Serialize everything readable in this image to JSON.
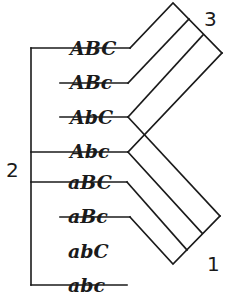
{
  "diagram": {
    "type": "genotype-grouping",
    "ink_color": "#1a1a1a",
    "background": "#ffffff",
    "group_labels": [
      {
        "id": "group-1",
        "text": "1"
      },
      {
        "id": "group-2",
        "text": "2"
      },
      {
        "id": "group-3",
        "text": "3"
      }
    ],
    "genotypes": [
      {
        "label": "ABC",
        "struck": true
      },
      {
        "label": "ABc",
        "struck": true
      },
      {
        "label": "AbC",
        "struck": true
      },
      {
        "label": "Abc",
        "struck": true
      },
      {
        "label": "aBC",
        "struck": true
      },
      {
        "label": "aBc",
        "struck": true
      },
      {
        "label": "abC",
        "struck": false
      },
      {
        "label": "abc",
        "struck": true
      }
    ],
    "groups": {
      "group_2_bracket": [
        "ABC",
        "Abc",
        "aBC",
        "abc"
      ],
      "group_3_upper_fan": [
        "ABC",
        "ABc",
        "AbC",
        "Abc"
      ],
      "group_1_lower_fan": [
        "AbC",
        "Abc",
        "aBC",
        "aBc"
      ]
    }
  }
}
